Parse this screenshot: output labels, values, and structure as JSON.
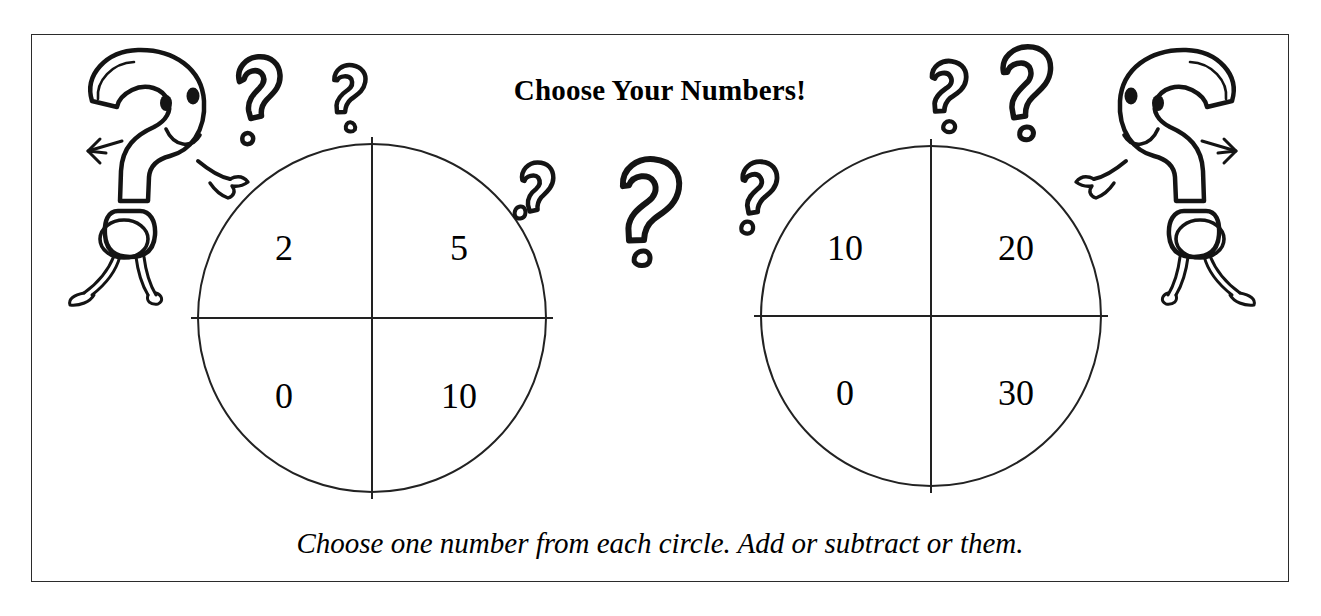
{
  "worksheet": {
    "title": "Choose Your Numbers!",
    "caption": "Choose one number from each circle. Add or subtract or them.",
    "border_color": "#2b2b2b",
    "ink_color": "#141414",
    "background_color": "#ffffff"
  },
  "spinners": [
    {
      "name": "left-spinner",
      "quadrants": {
        "top_left": "2",
        "top_right": "5",
        "bottom_left": "0",
        "bottom_right": "10"
      }
    },
    {
      "name": "right-spinner",
      "quadrants": {
        "top_left": "10",
        "top_right": "20",
        "bottom_left": "0",
        "bottom_right": "30"
      }
    }
  ],
  "decorations": {
    "left_character": "question-mark-character",
    "right_character": "question-mark-character",
    "floating_marks": [
      "question-mark-doodle",
      "question-mark-doodle",
      "question-mark-doodle",
      "question-mark-doodle",
      "question-mark-doodle",
      "question-mark-doodle",
      "question-mark-doodle"
    ]
  }
}
